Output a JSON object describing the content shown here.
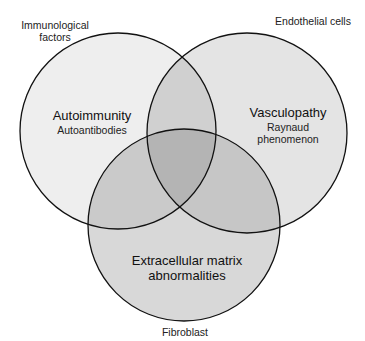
{
  "diagram": {
    "type": "venn",
    "sets": [
      {
        "id": "immunological",
        "outer_label": "Immunological\nfactors",
        "outer_label_lines": [
          "Immunological",
          "factors"
        ],
        "title": "Autoimmunity",
        "subtitle_lines": [
          "Autoantibodies"
        ],
        "fill": "#eeeeee",
        "circle": {
          "cx": 118,
          "cy": 131,
          "r": 98
        }
      },
      {
        "id": "endothelial",
        "outer_label": "Endothelial cells",
        "outer_label_lines": [
          "Endothelial cells"
        ],
        "title": "Vasculopathy",
        "subtitle_lines": [
          "Raynaud",
          "phenomenon"
        ],
        "fill": "#e4e4e4",
        "circle": {
          "cx": 247,
          "cy": 133,
          "r": 100
        }
      },
      {
        "id": "fibroblast",
        "outer_label": "Fibroblast",
        "outer_label_lines": [
          "Fibroblast"
        ],
        "title_lines": [
          "Extracellular matrix",
          "abnormalities"
        ],
        "subtitle_lines": [],
        "fill": "#d8d8d8",
        "circle": {
          "cx": 184,
          "cy": 225,
          "r": 96
        }
      }
    ],
    "overlap_colors": {
      "immunological_endothelial": "#cfcfcf",
      "immunological_fibroblast": "#c9c9c9",
      "endothelial_fibroblast": "#c4c4c4",
      "all_three": "#b3b3b3"
    },
    "stroke_color": "#111111",
    "background": "#ffffff"
  },
  "labels": {
    "immunological_line1": "Immunological",
    "immunological_line2": "factors",
    "endothelial": "Endothelial cells",
    "fibroblast": "Fibroblast",
    "autoimmunity": "Autoimmunity",
    "autoantibodies": "Autoantibodies",
    "vasculopathy": "Vasculopathy",
    "raynaud": "Raynaud",
    "phenomenon": "phenomenon",
    "ecm_line1": "Extracellular matrix",
    "ecm_line2": "abnormalities"
  }
}
